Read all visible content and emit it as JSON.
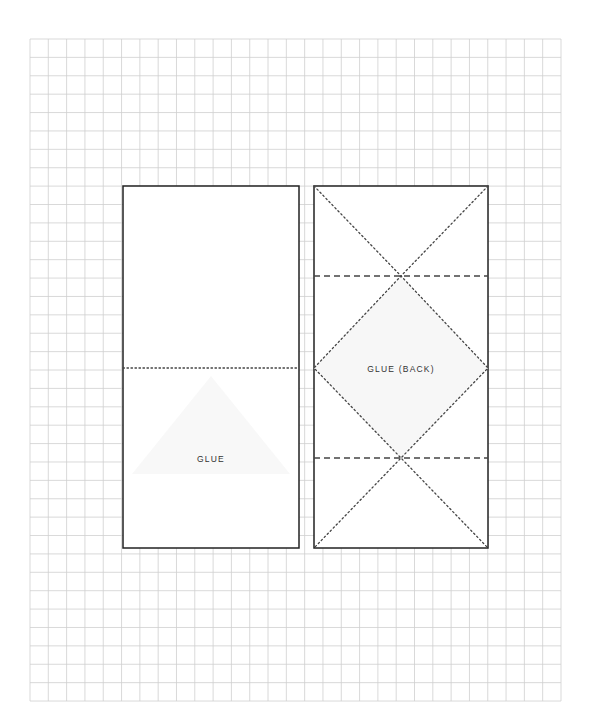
{
  "diagram": {
    "type": "paper-fold-template",
    "grid": {
      "x": 30,
      "y": 39,
      "columns": 29,
      "rows": 36,
      "cell": 18.31,
      "row_cell": 18.39,
      "color": "#cfcfcf"
    },
    "colors": {
      "outline": "#222222",
      "fold_line": "#444444",
      "text": "#333333",
      "glue_shade": "#f7f7f7",
      "paper": "#ffffff"
    },
    "panels": [
      {
        "id": "left-panel",
        "x": 123,
        "y": 186,
        "width": 176,
        "height": 362,
        "fold_lines": [
          {
            "style": "dotted",
            "orientation": "horizontal",
            "y": 368
          }
        ],
        "label": "GLUE",
        "label_position": {
          "x": 211,
          "y": 462
        }
      },
      {
        "id": "right-panel",
        "x": 314,
        "y": 186,
        "width": 174,
        "height": 362,
        "fold_lines": [
          {
            "style": "dashed",
            "orientation": "horizontal",
            "y": 276
          },
          {
            "style": "dashed",
            "orientation": "horizontal",
            "y": 458
          },
          {
            "style": "dotted",
            "orientation": "zigzag",
            "points": [
              [
                314,
                186
              ],
              [
                401,
                276
              ],
              [
                488,
                368
              ],
              [
                401,
                458
              ],
              [
                314,
                548
              ]
            ]
          },
          {
            "style": "dotted",
            "orientation": "zigzag",
            "points": [
              [
                488,
                186
              ],
              [
                401,
                276
              ],
              [
                314,
                368
              ],
              [
                401,
                458
              ],
              [
                488,
                548
              ]
            ]
          }
        ],
        "label": "GLUE (BACK)",
        "label_position": {
          "x": 401,
          "y": 372
        }
      }
    ],
    "legend": {
      "dotted_line": "fold line",
      "dashed_line": "fold line (alternate)"
    }
  },
  "labels": {
    "left_glue": "GLUE",
    "right_glue": "GLUE (BACK)"
  }
}
